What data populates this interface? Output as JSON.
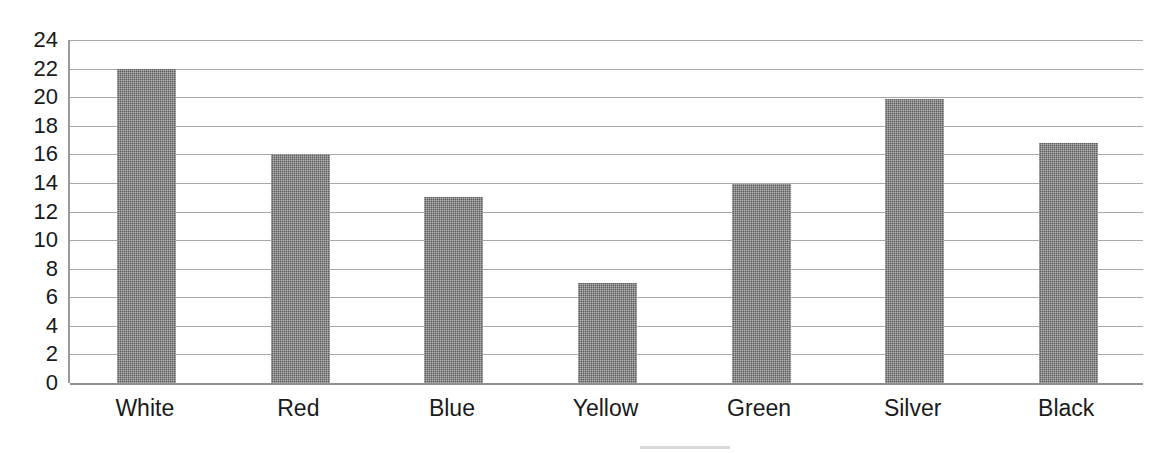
{
  "chart_data": {
    "type": "bar",
    "title": "",
    "subtitle": "",
    "xlabel": "",
    "ylabel": "",
    "categories": [
      "White",
      "Red",
      "Blue",
      "Yellow",
      "Green",
      "Silver",
      "Black"
    ],
    "values": [
      22,
      16,
      13,
      7,
      13.9,
      19.9,
      16.8
    ],
    "series": [
      {
        "name": "Count",
        "values": [
          22,
          16,
          13,
          7,
          13.9,
          19.9,
          16.8
        ]
      }
    ],
    "ylim": [
      0,
      24
    ],
    "ytick_step": 2,
    "ytick_labels": [
      "24",
      "22",
      "20",
      "18",
      "16",
      "14",
      "12",
      "10",
      "8",
      "6",
      "4",
      "2",
      "0"
    ],
    "ytick_values": [
      24,
      22,
      20,
      18,
      16,
      14,
      12,
      10,
      8,
      6,
      4,
      2,
      0
    ],
    "grid": true,
    "grid_orientation": "horizontal",
    "legend": false,
    "legend_position": "none",
    "bar_color": "#5c5c5c",
    "grid_color": "#a8a8a8",
    "axis_color": "#9a9a9a",
    "background_color": "#ffffff",
    "text_color": "#1a1a1a",
    "annotations": []
  },
  "page": {
    "title_remnant": "",
    "width": 1153,
    "height": 453
  }
}
